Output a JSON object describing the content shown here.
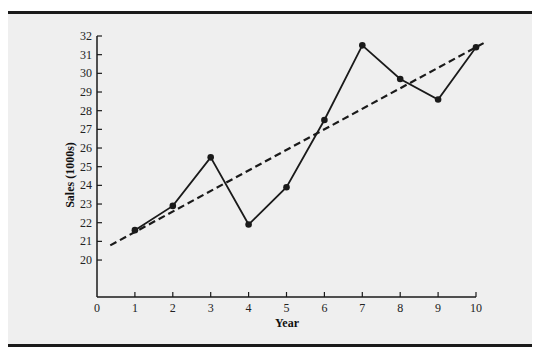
{
  "chart_data": {
    "type": "line",
    "title": "",
    "xlabel": "Year",
    "ylabel": "Sales (1000s)",
    "x": [
      1,
      2,
      3,
      4,
      5,
      6,
      7,
      8,
      9,
      10
    ],
    "series": [
      {
        "name": "Sales",
        "style": "solid-with-markers",
        "values": [
          21.6,
          22.9,
          25.5,
          21.9,
          23.9,
          27.5,
          31.5,
          29.7,
          28.6,
          31.4
        ]
      },
      {
        "name": "Linear trend",
        "style": "dashed",
        "intercept": 20.4,
        "slope": 1.1,
        "x_range": [
          0.35,
          10.2
        ]
      }
    ],
    "xlim": [
      0,
      10
    ],
    "ylim": [
      20,
      32
    ],
    "y_axis_break": true,
    "x_ticks": [
      "0",
      "1",
      "2",
      "3",
      "4",
      "5",
      "6",
      "7",
      "8",
      "9",
      "10"
    ],
    "y_ticks": [
      "20",
      "21",
      "22",
      "23",
      "24",
      "25",
      "26",
      "27",
      "28",
      "29",
      "30",
      "31",
      "32"
    ],
    "grid": false,
    "legend": "none",
    "colors": {
      "background": "#efefef",
      "line": "#1a1a1a",
      "axis": "#1a1a1a"
    }
  }
}
